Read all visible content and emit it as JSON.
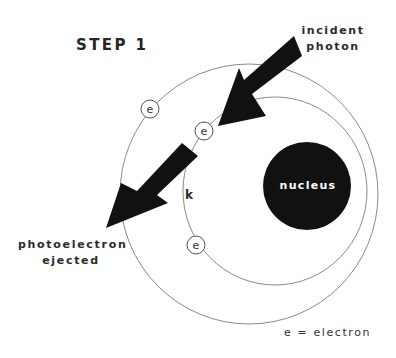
{
  "title": "STEP 1",
  "labels": {
    "incident": [
      "incident",
      "photon"
    ],
    "ejected": [
      "photoelectron",
      "ejected"
    ],
    "nucleus": "nucleus",
    "shell": "k",
    "electron_symbol": "e",
    "legend": "e = electron"
  },
  "colors": {
    "background": "#ffffff",
    "ink": "#111111",
    "orbit": "#8a8a8a",
    "text": "#2b2b2b",
    "nucleus_text": "#ffffff"
  },
  "geometry": {
    "outer_orbit": {
      "cx": 249,
      "cy": 194,
      "rx": 129,
      "ry": 130
    },
    "inner_orbit": {
      "cx": 275,
      "cy": 191,
      "rx": 92,
      "ry": 94
    },
    "nucleus": {
      "cx": 307,
      "cy": 186,
      "r": 44
    },
    "electrons": [
      {
        "cx": 150,
        "cy": 109,
        "r": 9,
        "shell": "outer"
      },
      {
        "cx": 204,
        "cy": 131,
        "r": 9,
        "shell": "inner"
      },
      {
        "cx": 196,
        "cy": 245,
        "r": 9,
        "shell": "inner"
      }
    ],
    "incident_arrow": [
      [
        294,
        36
      ],
      [
        302,
        56
      ],
      [
        252,
        94
      ],
      [
        266,
        116
      ],
      [
        218,
        126
      ],
      [
        239,
        68
      ],
      [
        244,
        80
      ]
    ],
    "ejected_arrow": [
      [
        182,
        143
      ],
      [
        198,
        156
      ],
      [
        157,
        195
      ],
      [
        168,
        203
      ],
      [
        106,
        228
      ],
      [
        121,
        183
      ],
      [
        137,
        191
      ]
    ]
  }
}
